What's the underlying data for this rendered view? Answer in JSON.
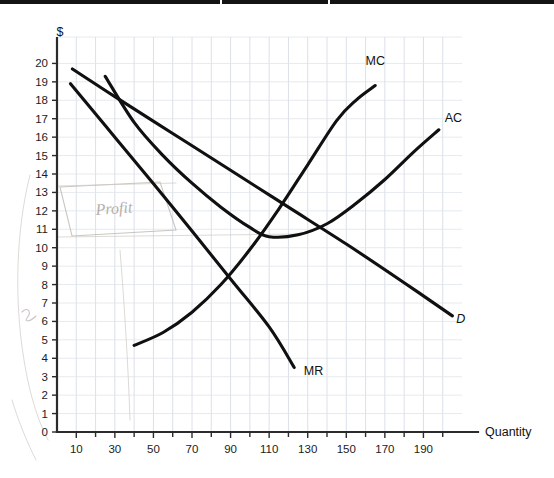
{
  "page": {
    "background_color": "#ffffff",
    "scan_edge_color": "#141414",
    "curve_color": "#101010",
    "grid_color": "#d7dde6",
    "axis_color": "#2b2b2b",
    "pencil_color": "#b9b3ab"
  },
  "axes": {
    "y_title": "$",
    "x_title": "Quantity",
    "y_ticks": [
      "0",
      "1",
      "2",
      "3",
      "4",
      "5",
      "6",
      "7",
      "8",
      "9",
      "10",
      "11",
      "12",
      "13",
      "14",
      "15",
      "16",
      "17",
      "18",
      "19",
      "20"
    ],
    "x_ticks": [
      "10",
      "30",
      "50",
      "70",
      "90",
      "110",
      "130",
      "150",
      "170",
      "190"
    ]
  },
  "annotations": {
    "pencil_note": "Profit"
  },
  "chart_data": {
    "type": "line",
    "title": "",
    "subtitle": "",
    "xlabel": "Quantity",
    "ylabel": "$",
    "xlim": [
      0,
      210
    ],
    "ylim": [
      0,
      21
    ],
    "grid": true,
    "legend_position": "inline-curve-labels",
    "x_tick_values": [
      10,
      30,
      50,
      70,
      90,
      110,
      130,
      150,
      170,
      190
    ],
    "y_tick_values": [
      0,
      1,
      2,
      3,
      4,
      5,
      6,
      7,
      8,
      9,
      10,
      11,
      12,
      13,
      14,
      15,
      16,
      17,
      18,
      19,
      20
    ],
    "series": [
      {
        "name": "D",
        "label": "D",
        "label_style": "italic",
        "description": "Demand curve, downward sloping straight line",
        "x": [
          8,
          30,
          60,
          90,
          120,
          150,
          180,
          205
        ],
        "y": [
          19.7,
          18.2,
          16.2,
          14.2,
          12.2,
          10.2,
          8.1,
          6.3
        ],
        "label_at": {
          "x": 207,
          "y": 5.9
        }
      },
      {
        "name": "MR",
        "label": "MR",
        "label_style": "normal",
        "description": "Marginal revenue curve, steeper downward sloping straight line",
        "x": [
          7,
          30,
          60,
          90,
          110,
          123
        ],
        "y": [
          18.9,
          16.0,
          12.2,
          8.3,
          5.7,
          3.5
        ],
        "label_at": {
          "x": 128,
          "y": 3.1
        }
      },
      {
        "name": "AC",
        "label": "AC",
        "label_style": "normal",
        "description": "Average cost curve, U-shaped with minimum near Q=110 at about $10.5",
        "x": [
          25,
          40,
          55,
          70,
          85,
          100,
          110,
          125,
          140,
          155,
          170,
          185,
          198
        ],
        "y": [
          19.3,
          16.8,
          15.0,
          13.5,
          12.2,
          11.1,
          10.6,
          10.7,
          11.3,
          12.4,
          13.7,
          15.2,
          16.4
        ],
        "label_at": {
          "x": 201,
          "y": 16.8
        }
      },
      {
        "name": "MC",
        "label": "MC",
        "label_style": "normal",
        "description": "Marginal cost curve, rising steeply, crosses AC near its minimum at about Q=133",
        "x": [
          40,
          55,
          70,
          85,
          100,
          115,
          130,
          145,
          155,
          165
        ],
        "y": [
          4.7,
          5.4,
          6.5,
          8.0,
          9.9,
          12.1,
          14.5,
          16.9,
          18.0,
          18.8
        ],
        "label_at": {
          "x": 160,
          "y": 19.9
        }
      }
    ],
    "intersections": [
      {
        "label": "MC crosses AC",
        "x": 133,
        "y": 11.0
      },
      {
        "label": "MC crosses MR",
        "x": 90,
        "y": 8.2
      },
      {
        "label": "D crosses AC",
        "x": 30,
        "y": 18.2
      }
    ]
  }
}
